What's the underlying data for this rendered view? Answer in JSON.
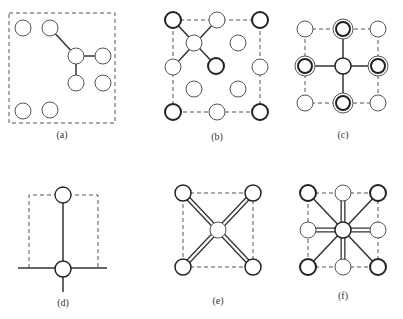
{
  "figure": {
    "panels": [
      {
        "id": "a",
        "label": "(a)",
        "description": "Scattered atoms in dashed square, one atom bonded to three neighbours"
      },
      {
        "id": "b",
        "label": "(b)",
        "description": "Face-centred lattice, atom bonded diagonally to four heavy-outlined atoms"
      },
      {
        "id": "c",
        "label": "(c)",
        "description": "Square lattice, central atom bonded to four double-ringed neighbours"
      },
      {
        "id": "d",
        "label": "(d)",
        "description": "Two atoms joined by vertical bond, lower atom on horizontal line"
      },
      {
        "id": "e",
        "label": "(e)",
        "description": "Central atom with four double diagonal bonds to corner atoms"
      },
      {
        "id": "f",
        "label": "(f)",
        "description": "Central atom with four double axial bonds and four single diagonal bonds"
      }
    ]
  },
  "colors": {
    "stroke": "#333333",
    "background": "#ffffff"
  }
}
